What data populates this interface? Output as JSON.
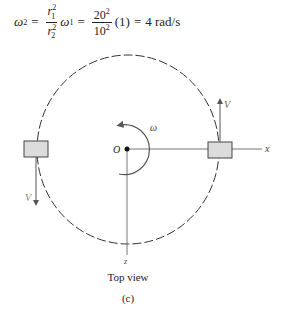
{
  "equation": {
    "lhs": "ω",
    "lhs_sub": "2",
    "eq1": "=",
    "frac1_num": "r",
    "frac1_num_sub": "1",
    "frac1_num_sup": "2",
    "frac1_den": "r",
    "frac1_den_sub": "2",
    "frac1_den_sup": "2",
    "omega1": "ω",
    "omega1_sub": "1",
    "eq2": "=",
    "frac2_num": "20",
    "frac2_num_sup": "2",
    "frac2_den": "10",
    "frac2_den_sup": "2",
    "factor": "(1)",
    "eq3": "=",
    "result": "4 rad/s"
  },
  "diagram": {
    "origin_label": "O",
    "omega_label": "ω",
    "x_axis_label": "x",
    "z_axis_label": "z",
    "velocity_label_right": "V",
    "velocity_label_left": "V",
    "colors": {
      "line": "#555555",
      "block_fill": "#dcdcdc",
      "block_stroke": "#444444",
      "circle": "#333333"
    }
  },
  "captions": {
    "view": "Top view",
    "figure": "(c)"
  }
}
